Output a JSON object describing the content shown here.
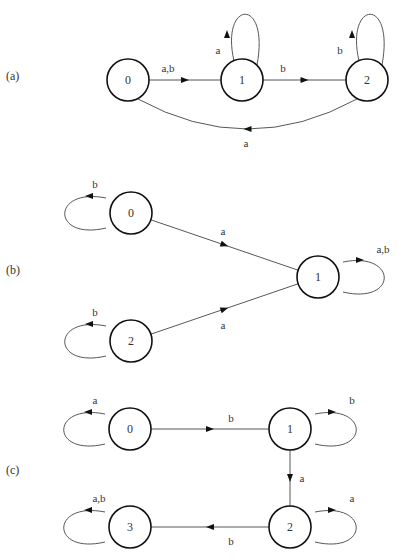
{
  "figure": {
    "panels": [
      {
        "id": "a",
        "label": "(a)",
        "label_pos": [
          6,
          80
        ],
        "states": [
          {
            "name": "0",
            "x": 128,
            "y": 80
          },
          {
            "name": "1",
            "x": 242,
            "y": 80
          },
          {
            "name": "2",
            "x": 367,
            "y": 80
          }
        ],
        "edges": [
          {
            "from": "0",
            "to": "1",
            "label": "a,b",
            "type": "straight",
            "label_pos": [
              168,
              72
            ]
          },
          {
            "from": "1",
            "to": "2",
            "label": "b",
            "type": "straight",
            "label_pos": [
              283,
              72
            ]
          },
          {
            "from": "2",
            "to": "0",
            "label": "a",
            "type": "curve-below",
            "label_pos": [
              246,
              147
            ]
          },
          {
            "from": "1",
            "to": "1",
            "label": "a",
            "type": "loop-up",
            "label_pos": [
              218,
              54
            ]
          },
          {
            "from": "2",
            "to": "2",
            "label": "b",
            "type": "loop-up",
            "label_pos": [
              340,
              54
            ]
          }
        ]
      },
      {
        "id": "b",
        "label": "(b)",
        "label_pos": [
          6,
          274
        ],
        "states": [
          {
            "name": "0",
            "x": 131,
            "y": 213
          },
          {
            "name": "1",
            "x": 318,
            "y": 277
          },
          {
            "name": "2",
            "x": 131,
            "y": 341
          }
        ],
        "edges": [
          {
            "from": "0",
            "to": "1",
            "label": "a",
            "type": "straight",
            "label_pos": [
              223,
              235
            ]
          },
          {
            "from": "2",
            "to": "1",
            "label": "a",
            "type": "straight",
            "label_pos": [
              223,
              329
            ]
          },
          {
            "from": "0",
            "to": "0",
            "label": "b",
            "type": "loop-left",
            "label_pos": [
              95,
              188
            ]
          },
          {
            "from": "2",
            "to": "2",
            "label": "b",
            "type": "loop-left",
            "label_pos": [
              95,
              316
            ]
          },
          {
            "from": "1",
            "to": "1",
            "label": "a,b",
            "type": "loop-right",
            "label_pos": [
              383,
              253
            ]
          }
        ]
      },
      {
        "id": "c",
        "label": "(c)",
        "label_pos": [
          6,
          474
        ],
        "states": [
          {
            "name": "0",
            "x": 130,
            "y": 429
          },
          {
            "name": "1",
            "x": 290,
            "y": 429
          },
          {
            "name": "2",
            "x": 290,
            "y": 527
          },
          {
            "name": "3",
            "x": 130,
            "y": 527
          }
        ],
        "edges": [
          {
            "from": "0",
            "to": "1",
            "label": "b",
            "type": "straight",
            "label_pos": [
              231,
              422
            ]
          },
          {
            "from": "1",
            "to": "2",
            "label": "a",
            "type": "straight",
            "label_pos": [
              302,
              482
            ]
          },
          {
            "from": "2",
            "to": "3",
            "label": "b",
            "type": "straight",
            "label_pos": [
              231,
              545
            ]
          },
          {
            "from": "0",
            "to": "0",
            "label": "a",
            "type": "loop-left",
            "label_pos": [
              95,
              404
            ]
          },
          {
            "from": "1",
            "to": "1",
            "label": "b",
            "type": "loop-right",
            "label_pos": [
              352,
              404
            ]
          },
          {
            "from": "2",
            "to": "2",
            "label": "a",
            "type": "loop-right",
            "label_pos": [
              352,
              502
            ]
          },
          {
            "from": "3",
            "to": "3",
            "label": "a,b",
            "type": "loop-left",
            "label_pos": [
              99,
              502
            ]
          }
        ]
      }
    ],
    "colors": {
      "stroke": "#111111",
      "edge": "#444444",
      "text": "#333333",
      "background": "#ffffff"
    },
    "state_radius": 21
  }
}
